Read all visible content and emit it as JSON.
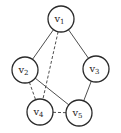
{
  "diagram": {
    "type": "undirected-graph",
    "node_radius": 13,
    "colors": {
      "stroke": "#2a2a2a",
      "edge": "#3a3a3a",
      "fill": "#ffffff",
      "background": "#ffffff"
    },
    "nodes": [
      {
        "id": "v1",
        "base": "v",
        "sub": "1",
        "x": 61,
        "y": 19
      },
      {
        "id": "v2",
        "base": "v",
        "sub": "2",
        "x": 25,
        "y": 70
      },
      {
        "id": "v3",
        "base": "v",
        "sub": "3",
        "x": 96,
        "y": 69
      },
      {
        "id": "v4",
        "base": "v",
        "sub": "4",
        "x": 40,
        "y": 112
      },
      {
        "id": "v5",
        "base": "v",
        "sub": "5",
        "x": 79,
        "y": 113
      }
    ],
    "edges": [
      {
        "from": "v1",
        "to": "v2",
        "style": "solid"
      },
      {
        "from": "v1",
        "to": "v3",
        "style": "solid"
      },
      {
        "from": "v2",
        "to": "v5",
        "style": "solid"
      },
      {
        "from": "v3",
        "to": "v5",
        "style": "solid"
      },
      {
        "from": "v1",
        "to": "v4",
        "style": "dashed"
      },
      {
        "from": "v2",
        "to": "v4",
        "style": "dashed"
      },
      {
        "from": "v4",
        "to": "v5",
        "style": "dashed"
      }
    ]
  }
}
